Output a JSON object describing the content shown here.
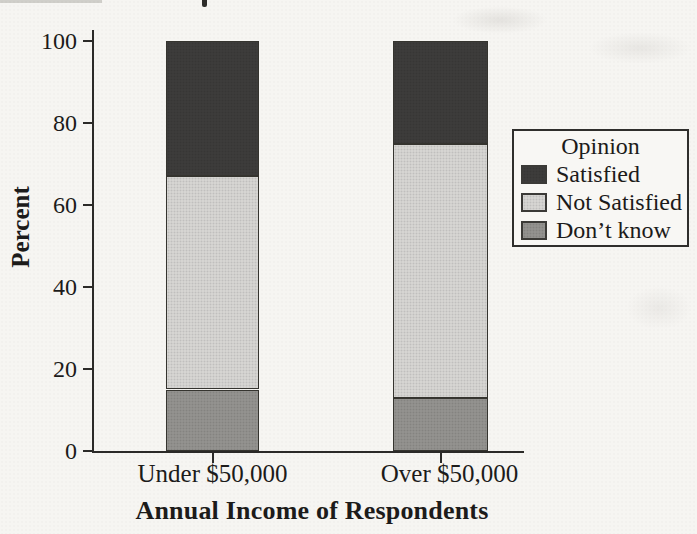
{
  "chart_data": {
    "type": "bar",
    "stacked": true,
    "title": "",
    "xlabel": "Annual Income of Respondents",
    "ylabel": "Percent",
    "categories": [
      "Under $50,000",
      "Over $50,000"
    ],
    "series": [
      {
        "name": "Don’t know",
        "values": [
          15,
          13
        ],
        "color": "#93928f"
      },
      {
        "name": "Not Satisfied",
        "values": [
          52,
          62
        ],
        "color": "#d6d5d2"
      },
      {
        "name": "Satisfied",
        "values": [
          33,
          25
        ],
        "color": "#3d3c3b"
      }
    ],
    "ylim": [
      0,
      100
    ],
    "yticks": [
      0,
      20,
      40,
      60,
      80,
      100
    ],
    "grid": false,
    "legend": {
      "title": "Opinion",
      "position": "right",
      "entries": [
        "Satisfied",
        "Not Satisfied",
        "Don’t know"
      ]
    }
  }
}
